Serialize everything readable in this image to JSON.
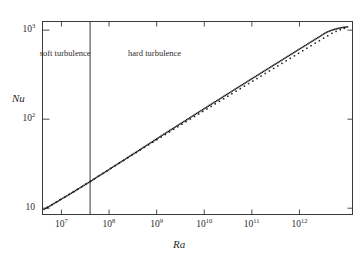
{
  "chart_data": {
    "type": "scatter",
    "title": "",
    "subtitle": "",
    "xlabel": "Ra",
    "ylabel": "Nu",
    "xscale": "log",
    "yscale": "log",
    "xlim": [
      4000000,
      13000000000000
    ],
    "ylim": [
      8.5,
      1250
    ],
    "grid": false,
    "legend": null,
    "xticks": [
      {
        "value": 10000000,
        "label": "10",
        "exponent": "7"
      },
      {
        "value": 100000000,
        "label": "10",
        "exponent": "8"
      },
      {
        "value": 1000000000,
        "label": "10",
        "exponent": "9"
      },
      {
        "value": 10000000000,
        "label": "10",
        "exponent": "10"
      },
      {
        "value": 100000000000,
        "label": "10",
        "exponent": "11"
      },
      {
        "value": 1000000000000,
        "label": "10",
        "exponent": "12"
      }
    ],
    "yticks": [
      {
        "value": 10,
        "label": "10",
        "exponent": ""
      },
      {
        "value": 100,
        "label": "10",
        "exponent": "2"
      },
      {
        "value": 1000,
        "label": "10",
        "exponent": "3"
      }
    ],
    "annotations": [
      {
        "name": "soft-turbulence",
        "text": "soft turbulence",
        "x": 12000000,
        "y": 620
      },
      {
        "name": "hard-turbulence",
        "text": "hard turbulence",
        "x": 900000000,
        "y": 620
      },
      {
        "name": "transition-divider",
        "text": "",
        "x": 40000000,
        "y": null
      }
    ],
    "transition_ra": 40000000,
    "fit": {
      "prefactor": 0.215,
      "exponent": 0.282,
      "note": "Nu ~ Ra^0.28"
    },
    "points": [
      [
        4300000.0,
        9.7
      ],
      [
        4620000.0,
        9.95
      ],
      [
        4950000.0,
        10.1
      ],
      [
        5300000.0,
        10.35
      ],
      [
        5700000.0,
        10.55
      ],
      [
        6100000.0,
        10.8
      ],
      [
        6550000.0,
        11.05
      ],
      [
        7000000.0,
        11.3
      ],
      [
        7500000.0,
        11.55
      ],
      [
        8050000.0,
        11.82
      ],
      [
        8600000.0,
        12.05
      ],
      [
        9200000.0,
        12.35
      ],
      [
        9900000.0,
        12.62
      ],
      [
        10600000.0,
        12.92
      ],
      [
        11400000.0,
        13.2
      ],
      [
        12200000.0,
        13.5
      ],
      [
        13000000.0,
        13.78
      ],
      [
        14000000.0,
        14.1
      ],
      [
        15000000.0,
        14.42
      ],
      [
        16100000.0,
        14.75
      ],
      [
        17200000.0,
        15.05
      ],
      [
        18500000.0,
        15.42
      ],
      [
        19800000.0,
        15.78
      ],
      [
        21200000.0,
        16.12
      ],
      [
        22700000.0,
        16.5
      ],
      [
        24400000.0,
        16.9
      ],
      [
        26100000.0,
        17.28
      ],
      [
        28000000.0,
        17.68
      ],
      [
        30000000.0,
        18.08
      ],
      [
        32100000.0,
        18.5
      ],
      [
        34400000.0,
        18.95
      ],
      [
        36900000.0,
        19.38
      ],
      [
        39500000.0,
        19.85
      ],
      [
        42300000.0,
        20.3
      ],
      [
        45400000.0,
        20.78
      ],
      [
        48600000.0,
        21.28
      ],
      [
        52100000.0,
        21.78
      ],
      [
        55800000.0,
        22.3
      ],
      [
        59800000.0,
        22.82
      ],
      [
        64000000.0,
        23.38
      ],
      [
        68600000.0,
        23.92
      ],
      [
        73500000.0,
        24.5
      ],
      [
        78700000.0,
        25.08
      ],
      [
        84400000.0,
        25.68
      ],
      [
        90400000.0,
        26.28
      ],
      [
        96800000.0,
        26.92
      ],
      [
        104000000.0,
        27.55
      ],
      [
        111000000.0,
        28.22
      ],
      [
        119000000.0,
        28.88
      ],
      [
        128000000.0,
        29.58
      ],
      [
        137000000.0,
        30.28
      ],
      [
        147000000.0,
        31.0
      ],
      [
        157000000.0,
        31.75
      ],
      [
        168000000.0,
        32.5
      ],
      [
        180000000.0,
        33.28
      ],
      [
        193000000.0,
        34.08
      ],
      [
        207000000.0,
        34.9
      ],
      [
        222000000.0,
        35.72
      ],
      [
        238000000.0,
        36.58
      ],
      [
        255000000.0,
        37.45
      ],
      [
        273000000.0,
        38.35
      ],
      [
        292000000.0,
        39.25
      ],
      [
        313000000.0,
        40.2
      ],
      [
        335000000.0,
        41.15
      ],
      [
        359000000.0,
        42.15
      ],
      [
        385000000.0,
        43.15
      ],
      [
        412000000.0,
        44.18
      ],
      [
        442000000.0,
        45.25
      ],
      [
        473000000.0,
        46.32
      ],
      [
        507000000.0,
        47.45
      ],
      [
        543000000.0,
        48.58
      ],
      [
        582000000.0,
        49.75
      ],
      [
        623000000.0,
        50.95
      ],
      [
        668000000.0,
        52.18
      ],
      [
        715000000.0,
        53.42
      ],
      [
        766000000.0,
        54.72
      ],
      [
        821000000.0,
        56.02
      ],
      [
        879000000.0,
        57.38
      ],
      [
        942000000.0,
        58.75
      ],
      [
        1010000000.0,
        60.18
      ],
      [
        1080000000.0,
        61.62
      ],
      [
        1160000000.0,
        63.1
      ],
      [
        1240000000.0,
        64.62
      ],
      [
        1330000000.0,
        66.18
      ],
      [
        1420000000.0,
        67.75
      ],
      [
        1530000000.0,
        69.38
      ],
      [
        1630000000.0,
        71.02
      ],
      [
        1750000000.0,
        72.72
      ],
      [
        1880000000.0,
        74.45
      ],
      [
        2010000000.0,
        76.22
      ],
      [
        2150000000.0,
        78.02
      ],
      [
        2310000000.0,
        79.88
      ],
      [
        2470000000.0,
        81.75
      ],
      [
        2650000000.0,
        83.7
      ],
      [
        2840000000.0,
        85.68
      ],
      [
        3040000000.0,
        87.7
      ],
      [
        3260000000.0,
        89.78
      ],
      [
        3490000000.0,
        91.9
      ],
      [
        3740000000.0,
        94.08
      ],
      [
        4010000000.0,
        96.3
      ],
      [
        4290000000.0,
        98.58
      ],
      [
        4600000000.0,
        100.9
      ],
      [
        4930000000.0,
        103.3
      ],
      [
        5280000000.0,
        105.7
      ],
      [
        5660000000.0,
        108.2
      ],
      [
        6060000000.0,
        110.8
      ],
      [
        6490000000.0,
        113.4
      ],
      [
        6960000000.0,
        116.1
      ],
      [
        7450000000.0,
        118.8
      ],
      [
        7990000000.0,
        121.6
      ],
      [
        8560000000.0,
        124.5
      ],
      [
        9170000000.0,
        127.4
      ],
      [
        9820000000.0,
        130.4
      ],
      [
        10500000000.0,
        133.5
      ],
      [
        11300000000.0,
        136.6
      ],
      [
        12100000000.0,
        139.9
      ],
      [
        12900000000.0,
        143.1
      ],
      [
        13900000000.0,
        146.5
      ],
      [
        14800000000.0,
        150.0
      ],
      [
        15900000000.0,
        153.5
      ],
      [
        17000000000.0,
        157.1
      ],
      [
        18300000000.0,
        160.8
      ],
      [
        19600000000.0,
        164.6
      ],
      [
        21000000000.0,
        168.4
      ],
      [
        22500000000.0,
        172.4
      ],
      [
        24100000000.0,
        176.4
      ],
      [
        25800000000.0,
        180.6
      ],
      [
        27600000000.0,
        184.8
      ],
      [
        29600000000.0,
        189.1
      ],
      [
        31700000000.0,
        193.6
      ],
      [
        34000000000.0,
        198.1
      ],
      [
        36400000000.0,
        202.7
      ],
      [
        39000000000.0,
        207.5
      ],
      [
        41800000000.0,
        212.3
      ],
      [
        44700000000.0,
        217.3
      ],
      [
        47900000000.0,
        222.4
      ],
      [
        51300000000.0,
        227.6
      ],
      [
        55000000000.0,
        232.9
      ],
      [
        58900000000.0,
        238.3
      ],
      [
        63100000000.0,
        243.9
      ],
      [
        67600000000.0,
        249.6
      ],
      [
        72400000000.0,
        255.4
      ],
      [
        77600000000.0,
        261.4
      ],
      [
        83100000000.0,
        267.5
      ],
      [
        89100000000.0,
        273.7
      ],
      [
        95400000000.0,
        280.1
      ],
      [
        102000000000.0,
        286.6
      ],
      [
        110000000000.0,
        293.3
      ],
      [
        117000000000.0,
        300.1
      ],
      [
        126000000000.0,
        307.1
      ],
      [
        135000000000.0,
        314.2
      ],
      [
        144000000000.0,
        321.5
      ],
      [
        155000000000.0,
        329.0
      ],
      [
        166000000000.0,
        336.6
      ],
      [
        177000000000.0,
        344.4
      ],
      [
        190000000000.0,
        352.4
      ],
      [
        204000000000.0,
        360.6
      ],
      [
        218000000000.0,
        368.9
      ],
      [
        234000000000.0,
        377.5
      ],
      [
        250000000000.0,
        386.2
      ],
      [
        268000000000.0,
        395.1
      ],
      [
        287000000000.0,
        404.3
      ],
      [
        308000000000.0,
        413.6
      ],
      [
        330000000000.0,
        423.2
      ],
      [
        353000000000.0,
        433.0
      ],
      [
        378000000000.0,
        443.0
      ],
      [
        405000000000.0,
        453.3
      ],
      [
        434000000000.0,
        463.8
      ],
      [
        465000000000.0,
        474.5
      ],
      [
        498000000000.0,
        485.5
      ],
      [
        533000000000.0,
        496.7
      ],
      [
        571000000000.0,
        508.2
      ],
      [
        612000000000.0,
        520.0
      ],
      [
        655000000000.0,
        532.0
      ],
      [
        702000000000.0,
        544.3
      ],
      [
        752000000000.0,
        556.9
      ],
      [
        805000000000.0,
        569.8
      ],
      [
        862000000000.0,
        583.0
      ],
      [
        924000000000.0,
        596.5
      ],
      [
        989000000000.0,
        610.3
      ],
      [
        1060000000000.0,
        624.5
      ],
      [
        1140000000000.0,
        638.9
      ],
      [
        1220000000000.0,
        653.7
      ],
      [
        1300000000000.0,
        668.9
      ],
      [
        1400000000000.0,
        684.3
      ],
      [
        1500000000000.0,
        700.2
      ],
      [
        1600000000000.0,
        716.4
      ],
      [
        1720000000000.0,
        733.0
      ],
      [
        1840000000000.0,
        749.9
      ],
      [
        1970000000000.0,
        767.3
      ],
      [
        2110000000000.0,
        785.0
      ],
      [
        2260000000000.0,
        803.2
      ],
      [
        2420000000000.0,
        821.7
      ],
      [
        2590000000000.0,
        840.7
      ],
      [
        2780000000000.0,
        860.2
      ],
      [
        2970000000000.0,
        880.1
      ],
      [
        3190000000000.0,
        900.4
      ],
      [
        3410000000000.0,
        921.2
      ],
      [
        3660000000000.0,
        940.0
      ],
      [
        3910000000000.0,
        957.0
      ],
      [
        4190000000000.0,
        972.0
      ],
      [
        4490000000000.0,
        986.0
      ],
      [
        4810000000000.0,
        999.0
      ],
      [
        5150000000000.0,
        1011.0
      ],
      [
        5510000000000.0,
        1022.0
      ],
      [
        5910000000000.0,
        1032.0
      ],
      [
        6320000000000.0,
        1042.0
      ],
      [
        6770000000000.0,
        1051.0
      ],
      [
        7250000000000.0,
        1059.0
      ],
      [
        7770000000000.0,
        1066.0
      ],
      [
        8320000000000.0,
        1072.0
      ],
      [
        8910000000000.0,
        1078.0
      ],
      [
        9540000000000.0,
        1083.0
      ],
      [
        10200000000000.0,
        1088.0
      ],
      [
        5100000.0,
        10.28
      ],
      [
        6300000.0,
        10.92
      ],
      [
        7800000.0,
        11.7
      ],
      [
        9500000.0,
        12.48
      ],
      [
        11800000.0,
        13.35
      ],
      [
        14500000.0,
        14.28
      ],
      [
        17800000.0,
        15.25
      ],
      [
        21800000.0,
        16.35
      ],
      [
        26800000.0,
        17.45
      ],
      [
        32800000.0,
        18.68
      ],
      [
        40200000.0,
        19.95
      ],
      [
        49200000.0,
        21.38
      ],
      [
        60200000.0,
        22.92
      ],
      [
        73800000.0,
        24.58
      ],
      [
        90200000.0,
        26.28
      ],
      [
        110000000.0,
        28.12
      ],
      [
        135000000.0,
        30.08
      ],
      [
        165000000.0,
        32.18
      ],
      [
        202000000.0,
        34.42
      ],
      [
        247000000.0,
        36.82
      ],
      [
        302000000.0,
        39.38
      ],
      [
        370000000.0,
        42.12
      ],
      [
        452000000.0,
        45.05
      ],
      [
        553000000.0,
        48.18
      ],
      [
        677000000.0,
        51.48
      ],
      [
        828000000.0,
        55.02
      ],
      [
        1010000000.0,
        58.85
      ],
      [
        1240000000.0,
        62.92
      ],
      [
        1520000000.0,
        67.25
      ],
      [
        1860000000.0,
        71.88
      ],
      [
        2270000000.0,
        76.82
      ],
      [
        2780000000.0,
        82.12
      ],
      [
        3400000000.0,
        87.75
      ],
      [
        4160000000.0,
        93.78
      ],
      [
        5090000000.0,
        100.2
      ],
      [
        6230000000.0,
        107.0
      ],
      [
        7620000000.0,
        114.3
      ],
      [
        9320000000.0,
        122.0
      ],
      [
        11400000000.0,
        130.3
      ],
      [
        13900000000.0,
        139.2
      ],
      [
        17000000000.0,
        148.6
      ],
      [
        20800000000.0,
        158.7
      ],
      [
        25500000000.0,
        169.4
      ],
      [
        31200000000.0,
        180.9
      ],
      [
        38100000000.0,
        193.1
      ],
      [
        46700000000.0,
        206.2
      ],
      [
        57100000000.0,
        220.1
      ],
      [
        69800000000.0,
        235.0
      ],
      [
        85400000000.0,
        250.9
      ],
      [
        105000000000.0,
        267.8
      ],
      [
        128000000000.0,
        285.9
      ],
      [
        156000000000.0,
        305.2
      ],
      [
        191000000000.0,
        325.8
      ],
      [
        234000000000.0,
        347.8
      ],
      [
        286000000000.0,
        371.3
      ],
      [
        350000000000.0,
        396.4
      ],
      [
        428000000000.0,
        423.2
      ],
      [
        524000000000.0,
        451.7
      ],
      [
        641000000000.0,
        482.2
      ],
      [
        784000000000.0,
        514.8
      ],
      [
        959000000000.0,
        549.5
      ],
      [
        1170000000000.0,
        586.6
      ],
      [
        1430000000000.0,
        626.2
      ],
      [
        1750000000000.0,
        668.4
      ],
      [
        2140000000000.0,
        713.5
      ],
      [
        2620000000000.0,
        761.6
      ],
      [
        3210000000000.0,
        812.9
      ],
      [
        3920000000000.0,
        864.0
      ],
      [
        4800000000000.0,
        920.0
      ],
      [
        5870000000000.0,
        968.0
      ],
      [
        7180000000000.0,
        1010.0
      ],
      [
        8780000000000.0,
        1048.0
      ]
    ]
  },
  "axes": {
    "y_title": "Nu",
    "x_title": "Ra"
  },
  "regions": {
    "soft": "soft turbulence",
    "hard": "hard turbulence"
  },
  "style": {
    "point_color": "#1a1a1a",
    "axis_color": "#3a3a3a",
    "text_color": "#2b2b2b",
    "background": "#ffffff"
  }
}
